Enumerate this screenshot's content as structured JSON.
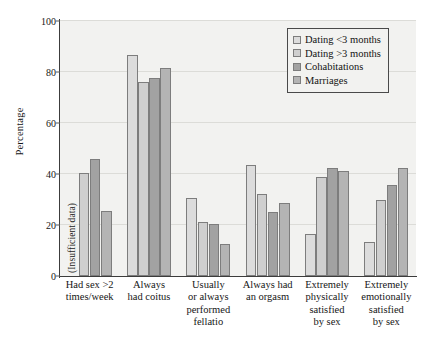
{
  "chart_data": {
    "type": "bar",
    "title": "",
    "xlabel": "",
    "ylabel": "Percentage",
    "ylim": [
      0,
      100
    ],
    "yticks": [
      0,
      20,
      40,
      60,
      80,
      100
    ],
    "grid": true,
    "legend_position": "top-right",
    "categories": [
      "Had sex >2 times/week",
      "Always had coitus",
      "Usually or always performed fellatio",
      "Always had an orgasm",
      "Extremely physically satisfied by sex",
      "Extremely emotionally satisfied by sex"
    ],
    "category_lines": [
      [
        "Had sex >2",
        "times/week"
      ],
      [
        "Always",
        "had coitus"
      ],
      [
        "Usually",
        "or always",
        "performed",
        "fellatio"
      ],
      [
        "Always had",
        "an orgasm"
      ],
      [
        "Extremely",
        "physically",
        "satisfied",
        "by sex"
      ],
      [
        "Extremely",
        "emotionally",
        "satisfied",
        "by sex"
      ]
    ],
    "series": [
      {
        "name": "Dating <3 months",
        "color": "#dcdcdc",
        "values": [
          null,
          86.5,
          30.5,
          43.5,
          16.5,
          13.5
        ]
      },
      {
        "name": "Dating >3 months",
        "color": "#cfcfcf",
        "values": [
          40.5,
          76.0,
          21.0,
          32.0,
          39.0,
          30.0
        ]
      },
      {
        "name": "Cohabitations",
        "color": "#a2a2a2",
        "values": [
          46.0,
          77.5,
          20.5,
          25.0,
          42.5,
          35.5
        ]
      },
      {
        "name": "Marriages",
        "color": "#b4b4b4",
        "values": [
          25.5,
          81.5,
          12.5,
          28.5,
          41.0,
          42.5
        ]
      }
    ],
    "annotations": [
      {
        "text": "(Insufficient data)",
        "category": "Had sex >2 times/week",
        "series": "Dating <3 months",
        "orientation": "vertical"
      }
    ]
  },
  "legend": {
    "entries": [
      {
        "label": "Dating <3 months",
        "swatch": "#dcdcdc"
      },
      {
        "label": "Dating >3 months",
        "swatch": "#cfcfcf"
      },
      {
        "label": "Cohabitations",
        "swatch": "#a2a2a2"
      },
      {
        "label": "Marriages",
        "swatch": "#b4b4b4"
      }
    ]
  },
  "axes": {
    "y_title": "Percentage",
    "y_tick_labels": [
      "0",
      "20",
      "40",
      "60",
      "80",
      "100"
    ]
  }
}
